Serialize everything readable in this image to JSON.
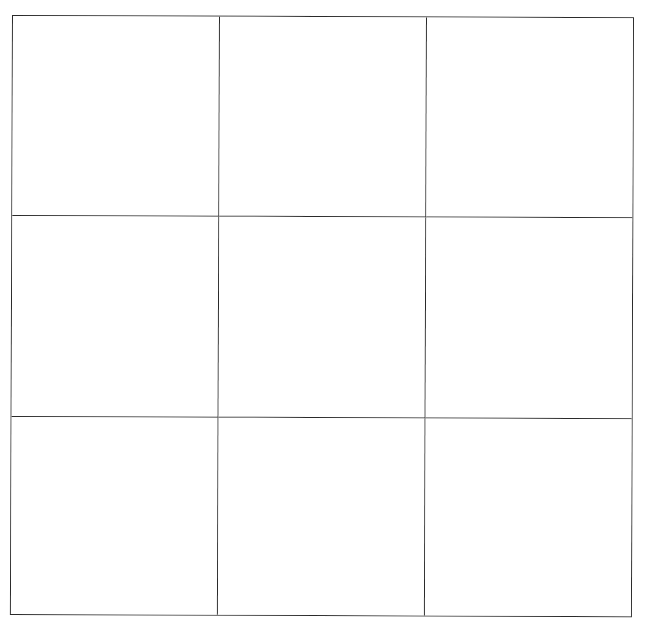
{
  "game": {
    "type": "tic-tac-toe",
    "rows": 3,
    "cols": 3,
    "line_color": "#2a2a2a",
    "background_color": "#ffffff",
    "cells": [
      [
        "",
        "",
        ""
      ],
      [
        "",
        "",
        ""
      ],
      [
        "",
        "",
        ""
      ]
    ]
  }
}
